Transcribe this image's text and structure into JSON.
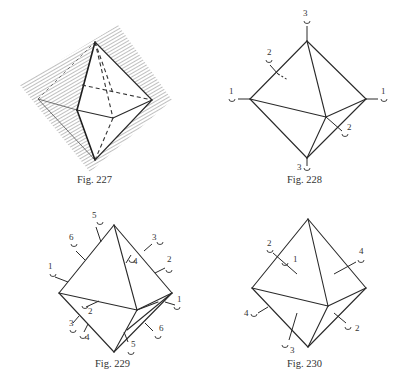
{
  "figures": [
    {
      "id": "fig227",
      "caption": "Fig. 227",
      "description": "Octahedron in perspective with hatched shaded rectangular plane behind it; hidden edges drawn dashed"
    },
    {
      "id": "fig228",
      "caption": "Fig. 228",
      "description": "Octahedron with rotation axes marked: two 1-fold labels on horizontal axis, two 2-fold labels on edge-midpoint axis, two 3-fold labels on vertical axis",
      "axis_labels": [
        "3",
        "2",
        "1",
        "1",
        "2",
        "3"
      ]
    },
    {
      "id": "fig229",
      "caption": "Fig. 229",
      "description": "Octahedron with six 2-fold axes through edge midpoints, labeled 1–6 at both ends",
      "axis_labels": [
        "5",
        "6",
        "1",
        "3",
        "2",
        "4",
        "1",
        "2",
        "3",
        "4",
        "5",
        "6"
      ]
    },
    {
      "id": "fig230",
      "caption": "Fig. 230",
      "description": "Octahedron with four 3-fold axes through face centers, labeled 1–4",
      "axis_labels": [
        "2",
        "1",
        "4",
        "4",
        "3",
        "2"
      ]
    }
  ]
}
